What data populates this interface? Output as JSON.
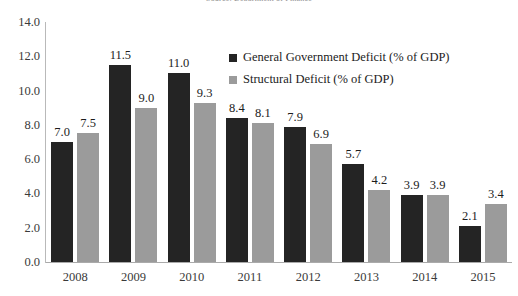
{
  "chart_data": {
    "type": "bar",
    "title": "",
    "subtitle": "",
    "source_note": "Source: Department of Finance",
    "xlabel": "",
    "ylabel": "",
    "ylim": [
      0,
      14
    ],
    "ytick_step": 2,
    "yticks": [
      "14.0",
      "12.0",
      "10.0",
      "8.0",
      "6.0",
      "4.0",
      "2.0",
      "0.0"
    ],
    "grid": false,
    "legend_position": "inside-top-center",
    "categories": [
      "2008",
      "2009",
      "2010",
      "2011",
      "2012",
      "2013",
      "2014",
      "2015"
    ],
    "series": [
      {
        "name": "General Government Deficit (% of GDP)",
        "color": "#242424",
        "values": [
          7.0,
          11.5,
          11.0,
          8.4,
          7.9,
          5.7,
          3.9,
          2.1
        ],
        "labels": [
          "7.0",
          "11.5",
          "11.0",
          "8.4",
          "7.9",
          "5.7",
          "3.9",
          "2.1"
        ]
      },
      {
        "name": "Structural Deficit (% of GDP)",
        "color": "#9b9b9b",
        "values": [
          7.5,
          9.0,
          9.3,
          8.1,
          6.9,
          4.2,
          3.9,
          3.4
        ],
        "labels": [
          "7.5",
          "9.0",
          "9.3",
          "8.1",
          "6.9",
          "4.2",
          "3.9",
          "3.4"
        ]
      }
    ]
  }
}
